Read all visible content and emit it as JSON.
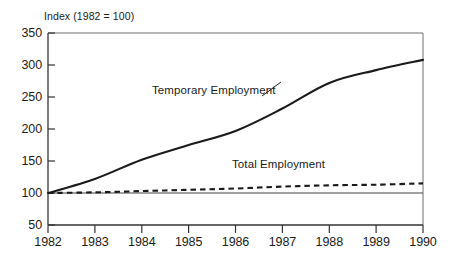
{
  "chart_data": {
    "type": "line",
    "title": "Index (1982 = 100)",
    "xlabel": "",
    "ylabel": "Index (1982 = 100)",
    "x": [
      1982,
      1983,
      1984,
      1985,
      1986,
      1987,
      1988,
      1989,
      1990
    ],
    "xtick_labels": [
      "1982",
      "1983",
      "1984",
      "1985",
      "1986",
      "1987",
      "1988",
      "1989",
      "1990"
    ],
    "ytick_labels": [
      "350",
      "300",
      "250",
      "200",
      "150",
      "100",
      "50"
    ],
    "yticks": [
      350,
      300,
      250,
      200,
      150,
      100,
      50
    ],
    "ylim": [
      50,
      350
    ],
    "xlim": [
      1982,
      1990
    ],
    "grid": false,
    "legend": "inline-annotations",
    "reference_line": 100,
    "series": [
      {
        "name": "Temporary Employment",
        "style": "solid",
        "color": "#1a1a1a",
        "values": [
          100,
          122,
          152,
          175,
          197,
          232,
          272,
          292,
          308
        ]
      },
      {
        "name": "Total Employment",
        "style": "dashed",
        "color": "#1a1a1a",
        "values": [
          100,
          101,
          103,
          105,
          107,
          110,
          112,
          113,
          115
        ]
      }
    ],
    "annotations": [
      {
        "text": "Temporary Employment",
        "x": 1985.1,
        "y": 258
      },
      {
        "text": "Total Employment",
        "x": 1986.7,
        "y": 140
      }
    ]
  }
}
